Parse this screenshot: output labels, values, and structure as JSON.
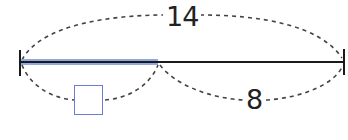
{
  "diagram": {
    "type": "tape-diagram",
    "total": {
      "label": "14",
      "value": 14
    },
    "parts": [
      {
        "name": "unknown",
        "label": "",
        "is_blank_box": true,
        "highlight_color": "#8fa8e0"
      },
      {
        "name": "known",
        "label": "8",
        "value": 8
      }
    ]
  },
  "colors": {
    "line": "#1a1a1a",
    "highlight": "#8fa8e0",
    "box_border": "#6b7fd1",
    "dash": "#444444"
  }
}
